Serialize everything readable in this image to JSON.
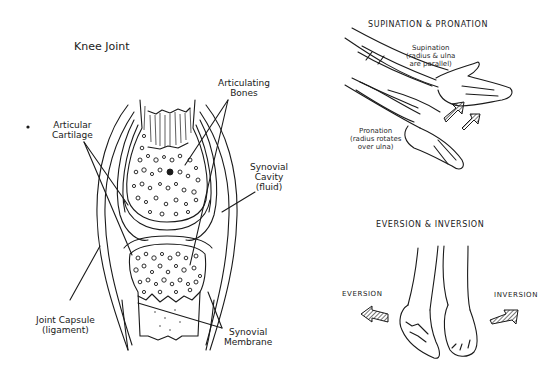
{
  "knee_joint": {
    "title": "Knee Joint",
    "labels": {
      "articulating_bones": [
        "Articulating",
        "Bones"
      ],
      "articular_cartilage": [
        "Articular",
        "Cartilage"
      ],
      "synovial_cavity": [
        "Synovial",
        "Cavity",
        "(fluid)"
      ],
      "joint_capsule": [
        "Joint Capsule",
        "(ligament)"
      ],
      "synovial_membrane": [
        "Synovial",
        "Membrane"
      ]
    }
  },
  "supination_pronation": {
    "title": "SUPINATION & PRONATION",
    "supination": [
      "Supination",
      "(radius & ulna",
      "are parallel)"
    ],
    "pronation": [
      "Pronation",
      "(radius rotates",
      "over ulna)"
    ]
  },
  "eversion_inversion": {
    "title": "EVERSION & INVERSION",
    "eversion": "EVERSION",
    "inversion": "INVERSION"
  },
  "colors": {
    "ink": "#1a1a1a",
    "background": "#ffffff"
  }
}
